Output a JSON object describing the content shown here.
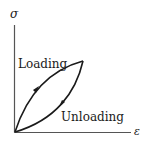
{
  "diagram": {
    "y_axis_symbol": "σ",
    "x_axis_symbol": "ε",
    "curves": [
      {
        "name": "loading",
        "label": "Loading",
        "direction": "origin-to-peak"
      },
      {
        "name": "unloading",
        "label": "Unloading",
        "direction": "peak-to-origin"
      }
    ],
    "colors": {
      "stroke": "#1a1a1a",
      "axis": "#555555",
      "background": "#ffffff"
    }
  }
}
